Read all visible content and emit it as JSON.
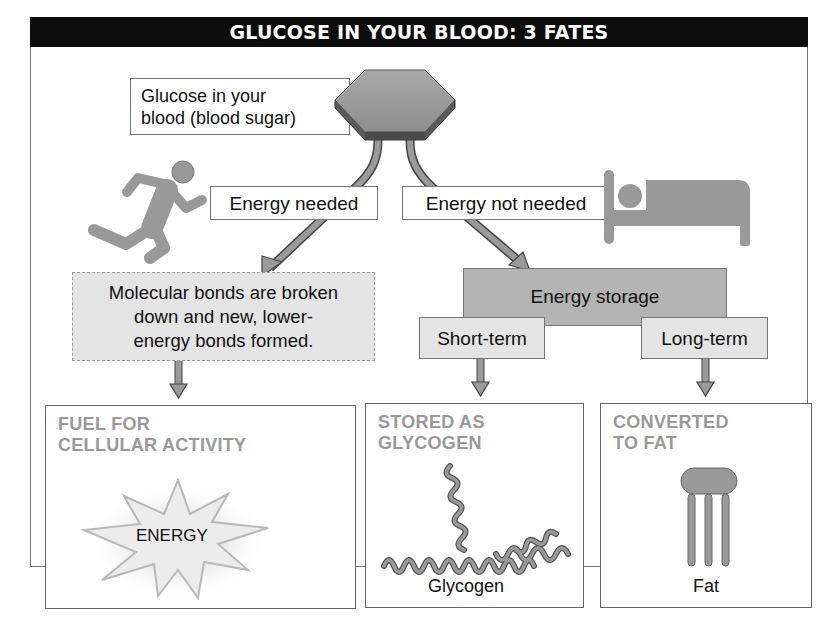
{
  "title": "GLUCOSE IN YOUR BLOOD: 3 FATES",
  "source": {
    "label_line1": "Glucose in your",
    "label_line2": "blood (blood sugar)",
    "icon": "glucose-hexagon-icon"
  },
  "branches": {
    "left": {
      "label": "Energy needed",
      "icon": "running-person-icon",
      "process_line1": "Molecular bonds are broken",
      "process_line2": "down and new, lower-",
      "process_line3": "energy bonds formed."
    },
    "right": {
      "label": "Energy not needed",
      "icon": "bed-sleeping-person-icon",
      "process": "Energy storage",
      "short_term": "Short-term",
      "long_term": "Long-term"
    }
  },
  "fates": [
    {
      "title_line1": "FUEL FOR",
      "title_line2": "CELLULAR ACTIVITY",
      "illustration_label": "ENERGY",
      "icon": "energy-burst-icon"
    },
    {
      "title_line1": "STORED AS",
      "title_line2": "GLYCOGEN",
      "illustration_label": "Glycogen",
      "icon": "glycogen-chain-icon"
    },
    {
      "title_line1": "CONVERTED",
      "title_line2": "TO FAT",
      "illustration_label": "Fat",
      "icon": "triglyceride-fat-icon"
    }
  ],
  "colors": {
    "title_bg": "#0c0c0c",
    "title_text": "#ffffff",
    "icon_gray": "#999999",
    "light_box": "#e4e4e4",
    "storage_box": "#b4b4b4",
    "fate_title": "#999999"
  }
}
